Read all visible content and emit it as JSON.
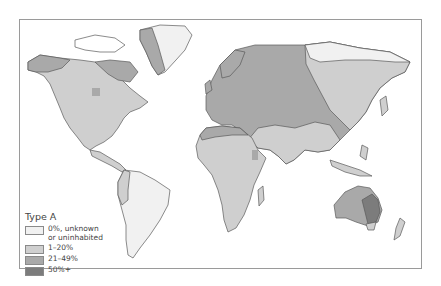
{
  "map": {
    "title": "Type A",
    "legend": [
      {
        "label": "0%, unknown\nor uninhabited",
        "color": "#f1f1f1"
      },
      {
        "label": "1–20%",
        "color": "#cfcfcf"
      },
      {
        "label": "21–49%",
        "color": "#a9a9a9"
      },
      {
        "label": "50%+",
        "color": "#7c7c7c"
      }
    ],
    "colors": {
      "outline": "#555555",
      "frame": "#9a9a9a"
    }
  }
}
